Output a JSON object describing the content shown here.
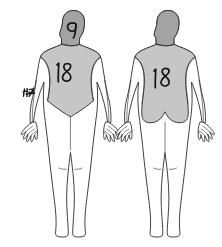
{
  "diagram": {
    "title": "Body surface area burn chart",
    "background_color": "#ffffff",
    "outline_color": "#2b2b2b",
    "ink_color": "#141414",
    "head_shade_color": "#a3a3a3",
    "torso_shade_color": "#c6c6c6",
    "skin_color": "#ffffff",
    "figures": [
      {
        "id": "anterior",
        "view_label": "Anterior",
        "head": {
          "name": "head-region",
          "shaded": true,
          "shade_color": "#a3a3a3",
          "annotation": "9"
        },
        "torso": {
          "name": "torso-region",
          "shaded": true,
          "shade_color": "#c6c6c6",
          "annotation": "18"
        },
        "arm_left": {
          "name": "left-arm-region",
          "shaded": false,
          "annotation": "4½"
        },
        "arm_right": {
          "name": "right-arm-region",
          "shaded": false,
          "annotation": ""
        },
        "legs": {
          "name": "legs-region",
          "shaded": false,
          "annotation": ""
        }
      },
      {
        "id": "posterior",
        "view_label": "Posterior",
        "head": {
          "name": "head-region",
          "shaded": true,
          "shade_color": "#a3a3a3",
          "annotation": ""
        },
        "torso": {
          "name": "torso-region",
          "shaded": true,
          "shade_color": "#c6c6c6",
          "annotation": "18"
        },
        "arm_left": {
          "name": "left-arm-region",
          "shaded": false,
          "annotation": ""
        },
        "arm_right": {
          "name": "right-arm-region",
          "shaded": false,
          "annotation": ""
        },
        "legs": {
          "name": "legs-region",
          "shaded": false,
          "annotation": ""
        }
      }
    ],
    "annotations": [
      {
        "id": "head-9",
        "text": "9",
        "figure": "anterior",
        "region": "head"
      },
      {
        "id": "front-torso-18",
        "text": "18",
        "figure": "anterior",
        "region": "torso"
      },
      {
        "id": "left-arm-mark",
        "text": "4½",
        "figure": "anterior",
        "region": "left-arm"
      },
      {
        "id": "back-torso-18",
        "text": "18",
        "figure": "posterior",
        "region": "torso"
      }
    ]
  }
}
